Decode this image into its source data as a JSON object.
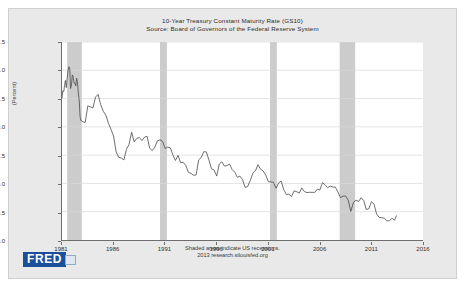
{
  "figure": {
    "title": "10-Year Treasury Constant Maturity Rate (GS10)",
    "source_line": "Source: Board of Governors of the Federal Reserve System",
    "footnote_1": "Shaded areas indicate US recessions.",
    "footnote_2": "2013 research.stlouisfed.org",
    "logo_text": "FRED",
    "background_color": "#e9e9e9",
    "plot_background_color": "#ffffff",
    "line_color": "#4a4a4a",
    "recession_band_color": "#cccccc",
    "grid_color": "#d8d8d8",
    "logo_color": "#1a4f9c"
  },
  "chart_data": {
    "type": "line",
    "title": "10-Year Treasury Constant Maturity Rate (GS10)",
    "subtitle": "Source: Board of Governors of the Federal Reserve System",
    "xlabel": "",
    "ylabel": "(Percent)",
    "xlim": [
      1981,
      2016
    ],
    "ylim": [
      0.0,
      17.5
    ],
    "grid": true,
    "legend": "none",
    "y_ticks": [
      0.0,
      2.5,
      5.0,
      7.5,
      10.0,
      12.5,
      15.0,
      17.5
    ],
    "y_tick_labels": [
      "0.0",
      "2.5",
      "5.0",
      "7.5",
      "10.0",
      "12.5",
      "15.0",
      "17.5"
    ],
    "x_ticks": [
      1981,
      1986,
      1991,
      1996,
      2001,
      2006,
      2011,
      2016
    ],
    "x_tick_labels": [
      "1981",
      "1986",
      "1991",
      "1996",
      "2001",
      "2006",
      "2011",
      "2016"
    ],
    "annotations": [
      "Shaded areas indicate US recessions.",
      "2013 research.stlouisfed.org"
    ],
    "recession_bands": [
      {
        "start": 1981.5,
        "end": 1982.92
      },
      {
        "start": 1990.5,
        "end": 1991.17
      },
      {
        "start": 2001.17,
        "end": 2001.83
      },
      {
        "start": 2007.92,
        "end": 2009.42
      }
    ],
    "series": [
      {
        "name": "10-Year Treasury Constant Maturity Rate",
        "x": [
          1981.0,
          1981.08,
          1981.17,
          1981.25,
          1981.33,
          1981.42,
          1981.5,
          1981.58,
          1981.67,
          1981.75,
          1981.83,
          1981.92,
          1982.0,
          1982.08,
          1982.17,
          1982.25,
          1982.33,
          1982.42,
          1982.5,
          1982.58,
          1982.67,
          1982.75,
          1982.83,
          1982.92,
          1983.0,
          1983.25,
          1983.5,
          1983.75,
          1984.0,
          1984.25,
          1984.5,
          1984.75,
          1985.0,
          1985.25,
          1985.5,
          1985.75,
          1986.0,
          1986.25,
          1986.5,
          1986.75,
          1987.0,
          1987.25,
          1987.5,
          1987.75,
          1988.0,
          1988.25,
          1988.5,
          1988.75,
          1989.0,
          1989.25,
          1989.5,
          1989.75,
          1990.0,
          1990.25,
          1990.5,
          1990.75,
          1991.0,
          1991.25,
          1991.5,
          1991.75,
          1992.0,
          1992.25,
          1992.5,
          1992.75,
          1993.0,
          1993.25,
          1993.5,
          1993.75,
          1994.0,
          1994.25,
          1994.5,
          1994.75,
          1995.0,
          1995.25,
          1995.5,
          1995.75,
          1996.0,
          1996.25,
          1996.5,
          1996.75,
          1997.0,
          1997.25,
          1997.5,
          1997.75,
          1998.0,
          1998.25,
          1998.5,
          1998.75,
          1999.0,
          1999.25,
          1999.5,
          1999.75,
          2000.0,
          2000.25,
          2000.5,
          2000.75,
          2001.0,
          2001.25,
          2001.5,
          2001.75,
          2002.0,
          2002.25,
          2002.5,
          2002.75,
          2003.0,
          2003.25,
          2003.5,
          2003.75,
          2004.0,
          2004.25,
          2004.5,
          2004.75,
          2005.0,
          2005.25,
          2005.5,
          2005.75,
          2006.0,
          2006.25,
          2006.5,
          2006.75,
          2007.0,
          2007.25,
          2007.5,
          2007.75,
          2008.0,
          2008.25,
          2008.5,
          2008.75,
          2009.0,
          2009.25,
          2009.5,
          2009.75,
          2010.0,
          2010.25,
          2010.5,
          2010.75,
          2011.0,
          2011.25,
          2011.5,
          2011.75,
          2012.0,
          2012.25,
          2012.5,
          2012.75,
          2013.0,
          2013.25,
          2013.42
        ],
        "values": [
          12.57,
          13.19,
          13.12,
          13.68,
          14.1,
          13.47,
          14.28,
          14.94,
          15.32,
          15.15,
          13.39,
          13.72,
          14.59,
          14.43,
          13.86,
          13.87,
          13.62,
          14.3,
          13.95,
          13.06,
          12.34,
          10.91,
          10.55,
          10.54,
          10.46,
          10.38,
          11.85,
          11.77,
          11.67,
          12.63,
          12.87,
          11.97,
          11.38,
          11.04,
          10.33,
          9.78,
          9.19,
          7.78,
          7.3,
          7.25,
          7.08,
          8.02,
          8.45,
          9.52,
          8.67,
          8.98,
          9.06,
          8.79,
          9.09,
          9.17,
          8.11,
          7.9,
          8.21,
          8.76,
          8.86,
          8.72,
          8.09,
          8.21,
          8.14,
          7.53,
          7.03,
          7.48,
          6.84,
          6.87,
          6.6,
          5.98,
          5.89,
          5.72,
          5.75,
          7.08,
          7.3,
          7.81,
          7.78,
          7.06,
          6.28,
          6.18,
          5.65,
          6.71,
          6.91,
          6.53,
          6.58,
          6.71,
          6.22,
          5.99,
          5.54,
          5.65,
          5.34,
          4.65,
          4.72,
          5.25,
          5.9,
          6.11,
          6.66,
          6.26,
          6.1,
          5.75,
          5.16,
          5.13,
          5.1,
          4.57,
          5.04,
          5.21,
          4.45,
          4.03,
          4.05,
          3.83,
          4.34,
          4.27,
          4.15,
          4.6,
          4.28,
          4.19,
          4.22,
          4.21,
          4.21,
          4.49,
          4.42,
          5.07,
          4.88,
          4.63,
          4.76,
          4.69,
          4.67,
          4.26,
          3.74,
          3.88,
          3.89,
          3.53,
          2.52,
          3.31,
          3.52,
          3.4,
          3.73,
          3.49,
          2.7,
          2.76,
          3.39,
          3.17,
          2.3,
          2.0,
          1.97,
          1.93,
          1.68,
          1.72,
          1.91,
          1.76,
          2.13
        ]
      }
    ]
  },
  "axis": {
    "y_label": "(Percent)"
  }
}
